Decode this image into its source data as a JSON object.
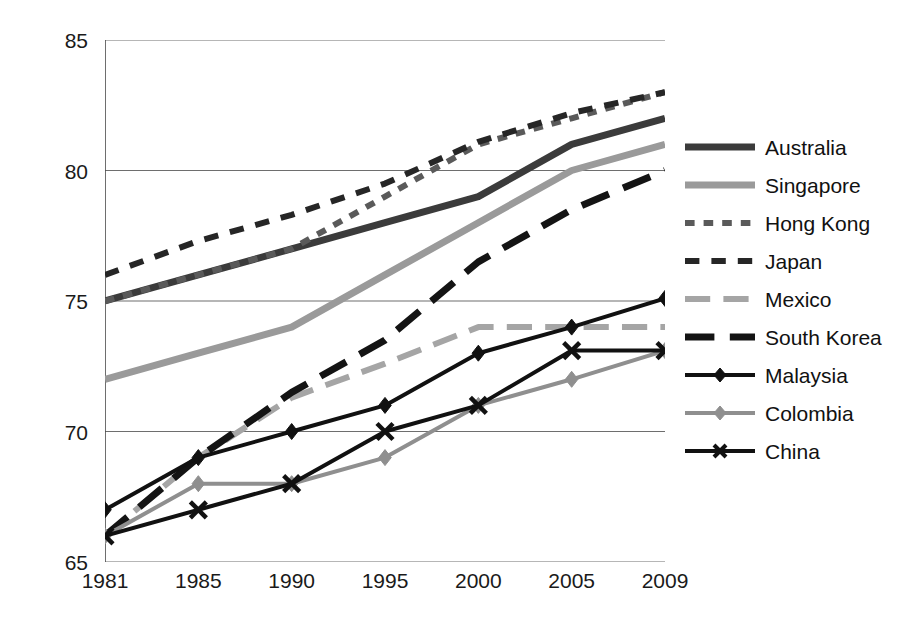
{
  "chart_data": {
    "type": "line",
    "title": "",
    "subtitle": "",
    "xlabel": "",
    "ylabel": "",
    "categories": [
      "1981",
      "1985",
      "1990",
      "1995",
      "2000",
      "2005",
      "2009"
    ],
    "xlim": [
      "1981",
      "2009"
    ],
    "ylim": [
      65,
      85
    ],
    "yticks": [
      65,
      70,
      75,
      80,
      85
    ],
    "grid": "horizontal",
    "legend_position": "right",
    "series": [
      {
        "name": "Australia",
        "values": [
          75,
          76,
          77,
          78,
          79,
          81,
          82
        ],
        "color": "#3b3b3b",
        "style": "solid",
        "width": 7,
        "marker": "none"
      },
      {
        "name": "Singapore",
        "values": [
          72,
          73,
          74,
          76,
          78,
          80,
          81
        ],
        "color": "#9a9a9a",
        "style": "solid",
        "width": 7,
        "marker": "none"
      },
      {
        "name": "Hong Kong",
        "values": [
          75,
          76,
          77,
          79,
          81,
          82,
          83
        ],
        "color": "#5a5a5a",
        "style": "dotted-dash",
        "width": 6,
        "marker": "none"
      },
      {
        "name": "Japan",
        "values": [
          76,
          77.3,
          78.3,
          79.5,
          81.1,
          82.2,
          83
        ],
        "color": "#262626",
        "style": "dashed",
        "width": 6,
        "marker": "none"
      },
      {
        "name": "Mexico",
        "values": [
          66,
          69,
          71.3,
          72.6,
          74,
          74,
          74
        ],
        "color": "#a5a5a5",
        "style": "long-dash",
        "width": 6,
        "marker": "none"
      },
      {
        "name": "South Korea",
        "values": [
          66,
          69,
          71.5,
          73.5,
          76.5,
          78.5,
          80
        ],
        "color": "#141414",
        "style": "long-dash",
        "width": 7,
        "marker": "none"
      },
      {
        "name": "Malaysia",
        "values": [
          67,
          69,
          70,
          71,
          73,
          74,
          75.1
        ],
        "color": "#111111",
        "style": "solid",
        "width": 4,
        "marker": "diamond"
      },
      {
        "name": "Colombia",
        "values": [
          66,
          68,
          68,
          69,
          71,
          72,
          73.1
        ],
        "color": "#8f8f8f",
        "style": "solid",
        "width": 4,
        "marker": "diamond"
      },
      {
        "name": "China",
        "values": [
          66,
          67,
          68,
          70,
          71,
          73.1,
          73.1
        ],
        "color": "#111111",
        "style": "solid",
        "width": 4,
        "marker": "x"
      }
    ]
  },
  "axes": {
    "y_tick_labels": [
      "85",
      "80",
      "75",
      "70",
      "65"
    ],
    "x_tick_labels": [
      "1981",
      "1985",
      "1990",
      "1995",
      "2000",
      "2005",
      "2009"
    ]
  },
  "legend": {
    "items": [
      {
        "label": "Australia"
      },
      {
        "label": "Singapore"
      },
      {
        "label": "Hong Kong"
      },
      {
        "label": "Japan"
      },
      {
        "label": "Mexico"
      },
      {
        "label": "South Korea"
      },
      {
        "label": "Malaysia"
      },
      {
        "label": "Colombia"
      },
      {
        "label": "China"
      }
    ]
  },
  "colors": {
    "axis": "#4a4a4a",
    "grid": "#6e6e6e",
    "text": "#1a1a1a",
    "background": "#ffffff"
  }
}
